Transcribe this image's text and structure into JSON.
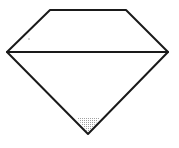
{
  "diagram": {
    "type": "gem-shape",
    "background": "#ffffff",
    "stroke": "#1a1a1a",
    "stroke_width": 2,
    "vertices": {
      "top_left": [
        50,
        10
      ],
      "top_right": [
        126,
        10
      ],
      "left": [
        7,
        52
      ],
      "right": [
        168,
        52
      ],
      "bottom": [
        88,
        134
      ]
    },
    "shaded_region": {
      "description": "stippled tip near bottom vertex",
      "color": "#9a9a9a",
      "points": [
        [
          77,
          118
        ],
        [
          100,
          118
        ],
        [
          88,
          133
        ]
      ]
    }
  }
}
